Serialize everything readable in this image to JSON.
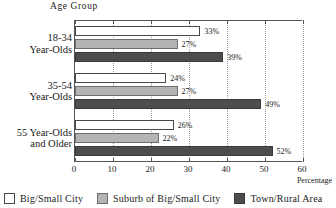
{
  "chart_data": {
    "type": "bar",
    "orientation": "horizontal",
    "title": "",
    "ylabel": "Age Group",
    "xlabel": "Percentage",
    "xlim": [
      0,
      60
    ],
    "xticks": [
      0,
      10,
      20,
      30,
      40,
      50,
      60
    ],
    "xtick_labels": [
      "0",
      "10",
      "20",
      "30",
      "40",
      "50",
      "60"
    ],
    "grid": "vertical-dotted",
    "legend_position": "bottom",
    "categories": [
      "18-34 Year-Olds",
      "35-54 Year-Olds",
      "55 Year-Olds and Older"
    ],
    "category_lines": [
      [
        "18-34",
        "Year-Olds"
      ],
      [
        "35-54",
        "Year-Olds"
      ],
      [
        "55  Year-Olds",
        "and Older"
      ]
    ],
    "series": [
      {
        "name": "Big/Small City",
        "color": "#ffffff",
        "values": [
          33,
          24,
          26
        ],
        "labels": [
          "33%",
          "24%",
          "26%"
        ]
      },
      {
        "name": "Suburb of Big/Small City",
        "color": "#b4b4b4",
        "values": [
          27,
          27,
          22
        ],
        "labels": [
          "27%",
          "27%",
          "22%"
        ]
      },
      {
        "name": "Town/Rural Area",
        "color": "#4d4d4d",
        "values": [
          39,
          49,
          52
        ],
        "labels": [
          "39%",
          "49%",
          "52%"
        ]
      }
    ]
  },
  "legend": {
    "items": [
      {
        "label": "Big/Small City"
      },
      {
        "label": "Suburb of Big/Small City"
      },
      {
        "label": "Town/Rural Area"
      }
    ]
  }
}
